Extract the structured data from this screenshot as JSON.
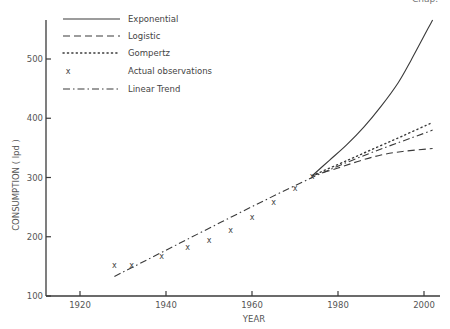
{
  "header": {
    "running_head_right": "Chap."
  },
  "chart_data": {
    "type": "line",
    "title": "",
    "xlabel": "YEAR",
    "ylabel": "CONSUMPTION ( lpd )",
    "xlim": [
      1913,
      2003
    ],
    "ylim": [
      100,
      560
    ],
    "xticks": [
      1920,
      1940,
      1960,
      1980,
      2000
    ],
    "yticks": [
      100,
      200,
      300,
      400,
      500
    ],
    "grid": false,
    "legend_position": "top-left",
    "legend": [
      {
        "label": "Exponential",
        "style": "solid"
      },
      {
        "label": "Logistic",
        "style": "dashed"
      },
      {
        "label": "Gompertz",
        "style": "dotted"
      },
      {
        "label": "Actual observations",
        "style": "x-marker"
      },
      {
        "label": "Linear Trend",
        "style": "dash-dot"
      }
    ],
    "series": [
      {
        "name": "Actual observations",
        "style": "x-marker",
        "x": [
          1928,
          1932,
          1939,
          1945,
          1950,
          1955,
          1960,
          1965,
          1970,
          1974
        ],
        "y": [
          152,
          152,
          168,
          183,
          195,
          212,
          234,
          258,
          283,
          302
        ]
      },
      {
        "name": "Linear Trend",
        "style": "dash-dot",
        "x": [
          1928,
          1974,
          2002
        ],
        "y": [
          133,
          300,
          380
        ]
      },
      {
        "name": "Exponential",
        "style": "solid",
        "x": [
          1974,
          1978,
          1982,
          1986,
          1990,
          1994,
          1997,
          2002
        ],
        "y": [
          303,
          329,
          355,
          385,
          420,
          460,
          498,
          566
        ]
      },
      {
        "name": "Logistic",
        "style": "dashed",
        "x": [
          1974,
          1980,
          1985,
          1990,
          1995,
          2002
        ],
        "y": [
          303,
          316,
          328,
          338,
          344,
          349
        ]
      },
      {
        "name": "Gompertz",
        "style": "dotted",
        "x": [
          1974,
          1980,
          1985,
          1990,
          1995,
          2002
        ],
        "y": [
          303,
          322,
          338,
          354,
          370,
          393
        ]
      }
    ]
  }
}
